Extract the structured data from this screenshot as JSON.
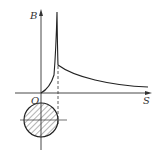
{
  "diagram": {
    "y_axis_label": "B",
    "x_axis_label": "S",
    "origin_label": "O",
    "colors": {
      "line": "#333333",
      "background": "#ffffff"
    },
    "elements": [
      "y-axis-arrow",
      "x-axis-arrow",
      "field-curve",
      "dashed-radius-line",
      "conductor-cross-section-hatched"
    ]
  }
}
